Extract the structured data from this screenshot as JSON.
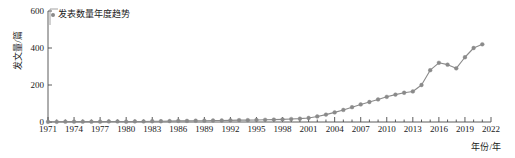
{
  "chart_data": {
    "type": "line",
    "title": "",
    "xlabel": "年份/年",
    "ylabel": "发文量/篇",
    "legend": [
      "发表数量年度趋势"
    ],
    "legend_position": "top-left",
    "grid": false,
    "xlim": [
      1971,
      2022
    ],
    "ylim": [
      0,
      600
    ],
    "yticks": [
      0,
      200,
      400,
      600
    ],
    "xticks": [
      1971,
      1974,
      1977,
      1980,
      1983,
      1986,
      1989,
      1992,
      1995,
      1998,
      2001,
      2004,
      2007,
      2010,
      2013,
      2016,
      2019,
      2022
    ],
    "series": [
      {
        "name": "发表数量年度趋势",
        "color": "#8a8a8a",
        "marker": "circle",
        "x": [
          1971,
          1972,
          1973,
          1974,
          1975,
          1976,
          1977,
          1978,
          1979,
          1980,
          1981,
          1982,
          1983,
          1984,
          1985,
          1986,
          1987,
          1988,
          1989,
          1990,
          1991,
          1992,
          1993,
          1994,
          1995,
          1996,
          1997,
          1998,
          1999,
          2000,
          2001,
          2002,
          2003,
          2004,
          2005,
          2006,
          2007,
          2008,
          2009,
          2010,
          2011,
          2012,
          2013,
          2014,
          2015,
          2016,
          2017,
          2018,
          2019,
          2020,
          2021
        ],
        "values": [
          1,
          1,
          2,
          2,
          2,
          2,
          2,
          3,
          3,
          2,
          3,
          3,
          4,
          4,
          5,
          6,
          6,
          7,
          7,
          8,
          8,
          9,
          10,
          10,
          11,
          12,
          13,
          14,
          16,
          18,
          22,
          30,
          40,
          52,
          65,
          80,
          95,
          108,
          122,
          136,
          148,
          158,
          165,
          200,
          280,
          320,
          310,
          290,
          350,
          400,
          420
        ]
      }
    ]
  },
  "axis": {
    "y_tick_labels": [
      "0",
      "200",
      "400",
      "600"
    ],
    "x_tick_labels": [
      "1971",
      "1974",
      "1977",
      "1980",
      "1983",
      "1986",
      "1989",
      "1992",
      "1995",
      "1998",
      "2001",
      "2004",
      "2007",
      "2010",
      "2013",
      "2016",
      "2019",
      "2022"
    ],
    "y_axis_title": "发文量/篇",
    "x_axis_title": "年份/年"
  },
  "legend": {
    "entries": [
      {
        "label": "发表数量年度趋势",
        "color": "#8a8a8a",
        "marker": "circle-marker"
      }
    ]
  }
}
